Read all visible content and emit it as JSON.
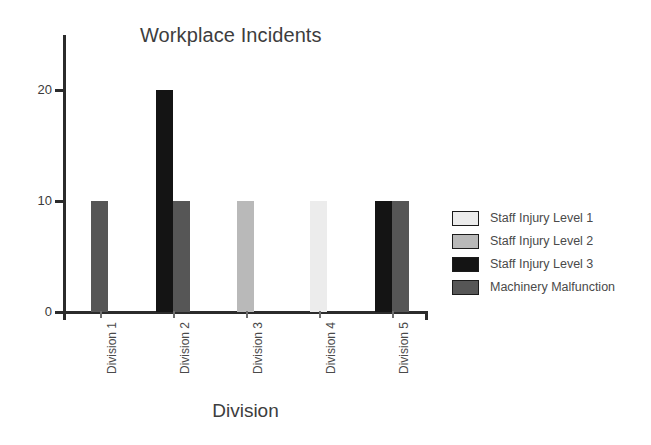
{
  "chart_data": {
    "type": "bar",
    "title": "Workplace Incidents",
    "xlabel": "Division",
    "ylabel": "",
    "categories": [
      "Division 1",
      "Division 2",
      "Division 3",
      "Division 4",
      "Division 5"
    ],
    "series": [
      {
        "name": "Staff Injury Level 1",
        "color": "#ececec",
        "values": [
          0,
          0,
          0,
          10,
          0
        ]
      },
      {
        "name": "Staff Injury Level 2",
        "color": "#b9b9b9",
        "values": [
          0,
          0,
          10,
          0,
          0
        ]
      },
      {
        "name": "Staff Injury Level 3",
        "color": "#141414",
        "values": [
          0,
          20,
          0,
          0,
          10
        ]
      },
      {
        "name": "Machinery Malfunction",
        "color": "#565656",
        "values": [
          10,
          10,
          0,
          0,
          10
        ]
      }
    ],
    "ylim": [
      0,
      25
    ],
    "yticks": [
      0,
      10,
      20
    ],
    "ytick_labels": [
      "0",
      "10",
      "20"
    ],
    "grid": false,
    "legend_position": "right",
    "axis_color": "#2b2b2b",
    "text_color": "#3d3d3d"
  },
  "legend": {
    "entries": [
      {
        "label": "Staff Injury Level 1"
      },
      {
        "label": "Staff Injury Level 2"
      },
      {
        "label": "Staff Injury Level 3"
      },
      {
        "label": "Machinery Malfunction"
      }
    ]
  }
}
